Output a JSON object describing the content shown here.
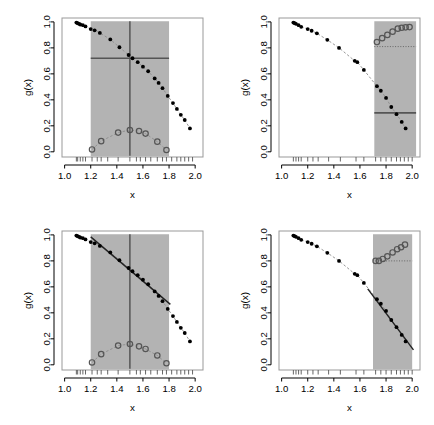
{
  "figure": {
    "width": 434,
    "height": 425,
    "background": "#ffffff",
    "layout": "2x2 grid of scatterplot panels"
  },
  "chart_data": [
    {
      "id": "panel-top-left",
      "type": "scatter",
      "title": "",
      "xlabel": "x",
      "ylabel": "g(x)",
      "xlim": [
        0.98,
        2.06
      ],
      "ylim": [
        -0.04,
        1.03
      ],
      "xticks": [
        1.0,
        1.2,
        1.4,
        1.6,
        1.8,
        2.0
      ],
      "xticklabels": [
        "1.0",
        "1.2",
        "1.4",
        "1.6",
        "1.8",
        "2.0"
      ],
      "yticks": [
        0.0,
        0.2,
        0.4,
        0.6,
        0.8,
        1.0
      ],
      "yticklabels": [
        "0.0",
        "0.2",
        "0.4",
        "0.6",
        "0.8",
        "1.0"
      ],
      "grid": false,
      "legend": "none",
      "shaded_region": {
        "x0": 1.2,
        "x1": 1.8,
        "y0": 0.0,
        "y1": 1.0,
        "color": "#b3b3b3"
      },
      "vertical_line": {
        "x": 1.5,
        "color": "#555555"
      },
      "horizontal_line": {
        "y": 0.72,
        "x0": 1.2,
        "x1": 1.8,
        "color": "#555555",
        "style": "solid"
      },
      "series": [
        {
          "name": "g(x) filled points",
          "marker": "filled-circle",
          "color": "#000000",
          "connector": "dashed-grey",
          "x": [
            1.09,
            1.1,
            1.11,
            1.12,
            1.14,
            1.16,
            1.2,
            1.23,
            1.27,
            1.35,
            1.42,
            1.49,
            1.52,
            1.56,
            1.6,
            1.64,
            1.69,
            1.72,
            1.75,
            1.79,
            1.83,
            1.86,
            1.89,
            1.92,
            1.96
          ],
          "y": [
            0.995,
            0.99,
            0.985,
            0.98,
            0.975,
            0.965,
            0.945,
            0.935,
            0.915,
            0.865,
            0.805,
            0.745,
            0.72,
            0.69,
            0.655,
            0.62,
            0.565,
            0.53,
            0.49,
            0.43,
            0.375,
            0.33,
            0.285,
            0.245,
            0.18
          ]
        },
        {
          "name": "bias open circles",
          "marker": "open-circle",
          "color": "#555555",
          "connector": "dashed-grey",
          "x": [
            1.21,
            1.28,
            1.41,
            1.5,
            1.57,
            1.62,
            1.71,
            1.78
          ],
          "y": [
            0.018,
            0.082,
            0.148,
            0.168,
            0.16,
            0.14,
            0.078,
            0.014
          ]
        }
      ],
      "rug_x": [
        1.09,
        1.1,
        1.12,
        1.14,
        1.16,
        1.21,
        1.25,
        1.28,
        1.33,
        1.41,
        1.5,
        1.55,
        1.58,
        1.62,
        1.66,
        1.71,
        1.75,
        1.78,
        1.82,
        1.86,
        1.89,
        1.92,
        1.95,
        1.98
      ]
    },
    {
      "id": "panel-top-right",
      "type": "scatter",
      "title": "",
      "xlabel": "x",
      "ylabel": "g(x)",
      "xlim": [
        0.98,
        2.06
      ],
      "ylim": [
        -0.04,
        1.03
      ],
      "xticks": [
        1.0,
        1.2,
        1.4,
        1.6,
        1.8,
        2.0
      ],
      "xticklabels": [
        "1.0",
        "1.2",
        "1.4",
        "1.6",
        "1.8",
        "2.0"
      ],
      "yticks": [
        0.0,
        0.2,
        0.4,
        0.6,
        0.8,
        1.0
      ],
      "yticklabels": [
        "0.0",
        "0.2",
        "0.4",
        "0.6",
        "0.8",
        "1.0"
      ],
      "grid": false,
      "legend": "none",
      "shaded_region": {
        "x0": 1.71,
        "x1": 2.03,
        "y0": 0.0,
        "y1": 1.0,
        "color": "#b3b3b3"
      },
      "vertical_line": null,
      "horizontal_line": {
        "y": 0.3,
        "x0": 1.71,
        "x1": 2.03,
        "color": "#555555",
        "style": "solid"
      },
      "dotted_line": {
        "y": 0.81,
        "x0": 1.71,
        "x1": 2.03,
        "color": "#666666",
        "style": "dotted"
      },
      "series": [
        {
          "name": "g(x) filled points",
          "marker": "filled-circle",
          "color": "#000000",
          "connector": "dashed-grey",
          "x": [
            1.09,
            1.1,
            1.11,
            1.13,
            1.15,
            1.2,
            1.23,
            1.27,
            1.35,
            1.44,
            1.56,
            1.58,
            1.63,
            1.73,
            1.76,
            1.8,
            1.84,
            1.88,
            1.92,
            1.95
          ],
          "y": [
            0.995,
            0.99,
            0.985,
            0.975,
            0.962,
            0.945,
            0.932,
            0.912,
            0.862,
            0.8,
            0.7,
            0.69,
            0.63,
            0.505,
            0.47,
            0.415,
            0.345,
            0.29,
            0.23,
            0.18
          ]
        },
        {
          "name": "bias open circles",
          "marker": "open-circle",
          "color": "#555555",
          "connector": "none",
          "x": [
            1.73,
            1.77,
            1.81,
            1.85,
            1.89,
            1.92,
            1.95,
            1.98
          ],
          "y": [
            0.845,
            0.875,
            0.9,
            0.925,
            0.948,
            0.955,
            0.958,
            0.96
          ]
        }
      ],
      "rug_x": [
        1.09,
        1.11,
        1.13,
        1.15,
        1.2,
        1.24,
        1.28,
        1.36,
        1.45,
        1.57,
        1.63,
        1.72,
        1.76,
        1.8,
        1.84,
        1.88,
        1.91,
        1.94,
        1.97,
        2.0
      ]
    },
    {
      "id": "panel-bottom-left",
      "type": "scatter",
      "title": "",
      "xlabel": "x",
      "ylabel": "g(x)",
      "xlim": [
        0.98,
        2.06
      ],
      "ylim": [
        -0.04,
        1.03
      ],
      "xticks": [
        1.0,
        1.2,
        1.4,
        1.6,
        1.8,
        2.0
      ],
      "xticklabels": [
        "1.0",
        "1.2",
        "1.4",
        "1.6",
        "1.8",
        "2.0"
      ],
      "yticks": [
        0.0,
        0.2,
        0.4,
        0.6,
        0.8,
        1.0
      ],
      "yticklabels": [
        "0.0",
        "0.2",
        "0.4",
        "0.6",
        "0.8",
        "1.0"
      ],
      "grid": false,
      "legend": "none",
      "shaded_region": {
        "x0": 1.2,
        "x1": 1.8,
        "y0": 0.0,
        "y1": 1.0,
        "color": "#b3b3b3"
      },
      "vertical_line": {
        "x": 1.5,
        "color": "#555555"
      },
      "horizontal_line": null,
      "fit_line": {
        "x0": 1.2,
        "y0": 0.985,
        "x1": 1.81,
        "y1": 0.465,
        "color": "#222222",
        "style": "solid"
      },
      "series": [
        {
          "name": "g(x) filled points",
          "marker": "filled-circle",
          "color": "#000000",
          "connector": "dashed-grey",
          "x": [
            1.09,
            1.1,
            1.11,
            1.12,
            1.14,
            1.16,
            1.2,
            1.23,
            1.27,
            1.35,
            1.42,
            1.49,
            1.52,
            1.56,
            1.6,
            1.64,
            1.69,
            1.72,
            1.75,
            1.79,
            1.83,
            1.86,
            1.89,
            1.92,
            1.96
          ],
          "y": [
            0.995,
            0.99,
            0.985,
            0.98,
            0.975,
            0.965,
            0.945,
            0.935,
            0.915,
            0.865,
            0.805,
            0.745,
            0.72,
            0.69,
            0.655,
            0.62,
            0.565,
            0.53,
            0.49,
            0.43,
            0.375,
            0.33,
            0.285,
            0.245,
            0.18
          ]
        },
        {
          "name": "bias open circles",
          "marker": "open-circle",
          "color": "#555555",
          "connector": "dashed-grey",
          "x": [
            1.21,
            1.28,
            1.41,
            1.5,
            1.57,
            1.62,
            1.71,
            1.78
          ],
          "y": [
            0.018,
            0.082,
            0.148,
            0.16,
            0.142,
            0.122,
            0.072,
            0.012
          ]
        }
      ],
      "rug_x": [
        1.09,
        1.1,
        1.12,
        1.14,
        1.16,
        1.21,
        1.25,
        1.28,
        1.33,
        1.41,
        1.5,
        1.55,
        1.58,
        1.62,
        1.66,
        1.71,
        1.75,
        1.78,
        1.82,
        1.86,
        1.89,
        1.92,
        1.95,
        1.98
      ]
    },
    {
      "id": "panel-bottom-right",
      "type": "scatter",
      "title": "",
      "xlabel": "x",
      "ylabel": "g(x)",
      "xlim": [
        0.98,
        2.06
      ],
      "ylim": [
        -0.04,
        1.03
      ],
      "xticks": [
        1.0,
        1.2,
        1.4,
        1.6,
        1.8,
        2.0
      ],
      "xticklabels": [
        "1.0",
        "1.2",
        "1.4",
        "1.6",
        "1.8",
        "2.0"
      ],
      "yticks": [
        0.0,
        0.2,
        0.4,
        0.6,
        0.8,
        1.0
      ],
      "yticklabels": [
        "0.0",
        "0.2",
        "0.4",
        "0.6",
        "0.8",
        "1.0"
      ],
      "grid": false,
      "legend": "none",
      "shaded_region": {
        "x0": 1.7,
        "x1": 2.0,
        "y0": 0.0,
        "y1": 1.0,
        "color": "#b3b3b3"
      },
      "vertical_line": null,
      "horizontal_line": null,
      "dotted_line": {
        "y": 0.8,
        "x0": 1.7,
        "x1": 2.0,
        "color": "#666666",
        "style": "dotted"
      },
      "fit_line": {
        "x0": 1.66,
        "y0": 0.585,
        "x1": 2.01,
        "y1": 0.115,
        "color": "#222222",
        "style": "solid"
      },
      "series": [
        {
          "name": "g(x) filled points",
          "marker": "filled-circle",
          "color": "#000000",
          "connector": "dashed-grey",
          "x": [
            1.09,
            1.1,
            1.11,
            1.13,
            1.15,
            1.2,
            1.23,
            1.27,
            1.35,
            1.44,
            1.56,
            1.58,
            1.63,
            1.73,
            1.76,
            1.8,
            1.84,
            1.88,
            1.92,
            1.95
          ],
          "y": [
            0.995,
            0.99,
            0.985,
            0.975,
            0.962,
            0.945,
            0.932,
            0.912,
            0.862,
            0.8,
            0.7,
            0.69,
            0.63,
            0.505,
            0.47,
            0.415,
            0.345,
            0.29,
            0.23,
            0.18
          ]
        },
        {
          "name": "bias open circles",
          "marker": "open-circle",
          "color": "#555555",
          "connector": "none",
          "x": [
            1.72,
            1.745,
            1.775,
            1.81,
            1.85,
            1.885,
            1.915,
            1.945
          ],
          "y": [
            0.8,
            0.8,
            0.815,
            0.835,
            0.865,
            0.89,
            0.905,
            0.925
          ]
        }
      ],
      "rug_x": [
        1.09,
        1.11,
        1.13,
        1.15,
        1.2,
        1.24,
        1.28,
        1.36,
        1.45,
        1.57,
        1.63,
        1.72,
        1.76,
        1.8,
        1.84,
        1.88,
        1.91,
        1.94,
        1.97,
        2.0
      ]
    }
  ]
}
